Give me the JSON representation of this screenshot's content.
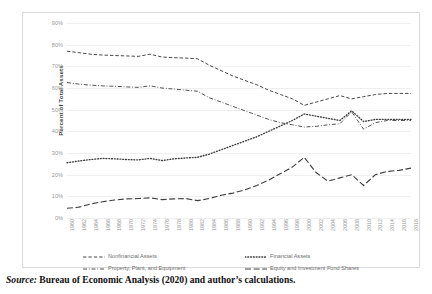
{
  "chart_data": {
    "type": "line",
    "title": "",
    "subtitle": "",
    "xlabel": "",
    "ylabel": "Percent of Total Assets",
    "ylim": [
      0,
      90
    ],
    "ytick_labels": [
      "90%",
      "80%",
      "70%",
      "60%",
      "50%",
      "40%",
      "30%",
      "20%",
      "10%",
      "0%"
    ],
    "ytick_values": [
      90,
      80,
      70,
      60,
      50,
      40,
      30,
      20,
      10,
      0
    ],
    "grid": true,
    "legend_position": "bottom",
    "x": [
      1960,
      1962,
      1964,
      1966,
      1968,
      1970,
      1972,
      1974,
      1976,
      1978,
      1980,
      1982,
      1984,
      1986,
      1988,
      1990,
      1992,
      1994,
      1996,
      1998,
      2000,
      2002,
      2004,
      2006,
      2008,
      2010,
      2012,
      2014,
      2016,
      2018
    ],
    "xtick_labels": [
      "1960",
      "1962",
      "1964",
      "1966",
      "1968",
      "1970",
      "1972",
      "1974",
      "1976",
      "1978",
      "1980",
      "1982",
      "1984",
      "1986",
      "1988",
      "1990",
      "1992",
      "1994",
      "1996",
      "1998",
      "2000",
      "2002",
      "2004",
      "2006",
      "2008",
      "2010",
      "2012",
      "2014",
      "2016",
      "2018"
    ],
    "series": [
      {
        "name": "Nonfinancial Assets",
        "style": "dashed",
        "color": "#3f3f3f",
        "values": [
          77.0,
          76.3,
          75.6,
          75.2,
          75.0,
          74.8,
          74.6,
          75.6,
          74.3,
          74.0,
          73.8,
          73.5,
          70.5,
          68.0,
          65.5,
          63.5,
          61.5,
          59.0,
          57.0,
          55.0,
          52.0,
          53.5,
          55.0,
          56.5,
          55.0,
          56.0,
          57.0,
          57.5,
          57.5,
          57.5
        ]
      },
      {
        "name": "Financial Assets",
        "style": "dotted",
        "color": "#3f3f3f",
        "values": [
          25.5,
          26.3,
          27.0,
          27.5,
          27.3,
          27.0,
          26.8,
          27.5,
          26.5,
          27.3,
          27.7,
          28.0,
          29.5,
          31.5,
          33.5,
          35.5,
          37.5,
          40.0,
          42.5,
          45.0,
          48.0,
          47.0,
          46.0,
          45.0,
          49.5,
          44.5,
          45.5,
          45.5,
          45.5,
          45.5
        ]
      },
      {
        "name": "Property, Plant, and Equipment",
        "style": "dashdot",
        "color": "#3f3f3f",
        "values": [
          62.5,
          61.8,
          61.3,
          61.0,
          60.8,
          60.5,
          60.3,
          61.0,
          60.0,
          59.5,
          59.0,
          58.5,
          55.5,
          53.5,
          51.5,
          49.5,
          47.5,
          45.5,
          44.0,
          43.0,
          42.0,
          42.3,
          43.0,
          43.5,
          49.0,
          41.0,
          44.0,
          45.0,
          45.0,
          45.0
        ]
      },
      {
        "name": "Equity and Investment Fund Shares",
        "style": "longdash",
        "color": "#3f3f3f",
        "values": [
          4.5,
          5.0,
          6.5,
          7.5,
          8.3,
          8.8,
          9.0,
          9.3,
          8.5,
          8.8,
          9.0,
          8.0,
          9.0,
          10.5,
          11.5,
          13.0,
          15.0,
          17.5,
          20.5,
          23.5,
          28.0,
          21.0,
          17.0,
          18.5,
          20.0,
          15.0,
          20.0,
          21.5,
          22.0,
          23.0
        ]
      }
    ]
  },
  "legend": {
    "items": [
      {
        "label": "Nonfinancial Assets",
        "style": "dashed"
      },
      {
        "label": "Financial Assets",
        "style": "dotted"
      },
      {
        "label": "Property, Plant, and Equipment",
        "style": "dashdot"
      },
      {
        "label": "Equity and Investment Fund Shares",
        "style": "longdash"
      }
    ]
  },
  "caption": {
    "source_word": "Source:",
    "source_text": "Bureau of Economic Analysis (2020) and author’s calculations."
  }
}
